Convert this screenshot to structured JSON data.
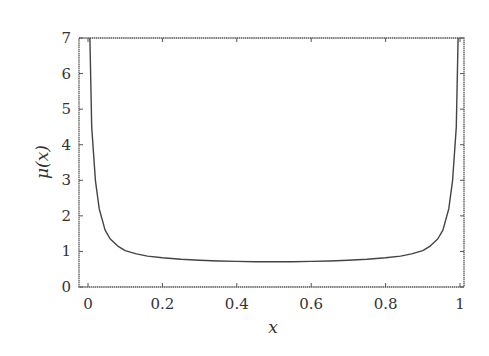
{
  "chart_data": {
    "type": "line",
    "title": "",
    "xlabel": "x",
    "ylabel": "μ(x)",
    "xlim": [
      0,
      1
    ],
    "ylim": [
      0,
      7
    ],
    "grid": false,
    "legend": null,
    "x_ticks": [
      "0",
      "0.2",
      "0.4",
      "0.6",
      "0.8",
      "1"
    ],
    "x_tick_values": [
      0,
      0.2,
      0.4,
      0.6,
      0.8,
      1
    ],
    "y_ticks": [
      "0",
      "1",
      "2",
      "3",
      "4",
      "5",
      "6",
      "7"
    ],
    "y_tick_values": [
      0,
      1,
      2,
      3,
      4,
      5,
      6,
      7
    ],
    "series": [
      {
        "name": "μ(x)",
        "x": [
          0.005,
          0.01,
          0.02,
          0.03,
          0.046,
          0.06,
          0.08,
          0.1,
          0.13,
          0.16,
          0.2,
          0.25,
          0.3,
          0.35,
          0.4,
          0.45,
          0.5,
          0.55,
          0.6,
          0.65,
          0.7,
          0.75,
          0.8,
          0.84,
          0.87,
          0.9,
          0.92,
          0.94,
          0.954,
          0.97,
          0.98,
          0.99,
          0.995
        ],
        "values": [
          7.0,
          4.5,
          3.0,
          2.2,
          1.6,
          1.35,
          1.15,
          1.02,
          0.93,
          0.87,
          0.82,
          0.78,
          0.75,
          0.73,
          0.72,
          0.71,
          0.71,
          0.71,
          0.72,
          0.73,
          0.75,
          0.78,
          0.82,
          0.87,
          0.93,
          1.02,
          1.15,
          1.35,
          1.6,
          2.2,
          3.0,
          4.5,
          7.0
        ]
      }
    ]
  },
  "plot_area": {
    "left_px": 79,
    "top_px": 38,
    "right_px": 464,
    "bottom_px": 287,
    "x0_px": 88,
    "x1_px": 460
  },
  "colors": {
    "line": "#444444",
    "frame": "#555555",
    "text": "#333333",
    "background": "#ffffff"
  }
}
